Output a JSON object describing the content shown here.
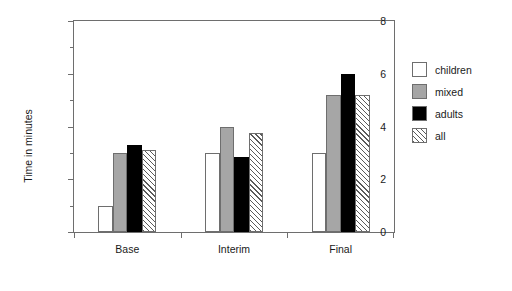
{
  "chart_data": {
    "type": "bar",
    "title": "",
    "xlabel": "",
    "ylabel": "Time in minutes",
    "categories": [
      "Base",
      "Interim",
      "Final"
    ],
    "series": [
      {
        "name": "children",
        "values": [
          1.0,
          3.0,
          3.0
        ],
        "color": "#ffffff",
        "pattern": "solid"
      },
      {
        "name": "mixed",
        "values": [
          3.0,
          4.0,
          5.2
        ],
        "color": "#a6a6a6",
        "pattern": "solid"
      },
      {
        "name": "adults",
        "values": [
          3.3,
          2.85,
          6.0
        ],
        "color": "#000000",
        "pattern": "solid"
      },
      {
        "name": "all",
        "values": [
          3.1,
          3.75,
          5.2
        ],
        "color": "#ffffff",
        "pattern": "diagonal-hatch"
      }
    ],
    "ylim": [
      0,
      8
    ],
    "yticks": [
      0,
      2,
      4,
      6,
      8
    ],
    "ytick_labels": [
      "0",
      "2",
      "4",
      "6",
      "8"
    ],
    "yminor_ticks": [
      1,
      3,
      5,
      7
    ],
    "grid": false,
    "legend_position": "right"
  },
  "legend": {
    "entries": [
      {
        "label": "children"
      },
      {
        "label": "mixed"
      },
      {
        "label": "adults"
      },
      {
        "label": "all"
      }
    ]
  },
  "axes": {
    "y_title": "Time in minutes"
  }
}
